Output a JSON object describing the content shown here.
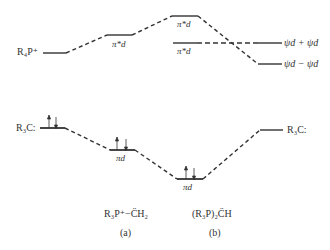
{
  "diagram": {
    "type": "molecular-orbital-energy-level-diagram",
    "upper": {
      "left_label": "R₄P⁺",
      "levels": [
        {
          "id": "pistar_a",
          "label": "π*d"
        },
        {
          "id": "pistar_b_upper",
          "label": "π*d"
        },
        {
          "id": "pistar_b_lower",
          "label": "π*d"
        }
      ],
      "right_levels": [
        {
          "id": "psi_plus",
          "label": "ψd + ψd"
        },
        {
          "id": "psi_minus",
          "label": "ψd − ψd"
        }
      ]
    },
    "lower": {
      "left_label": "R₃C:",
      "right_label": "R₃C:",
      "levels": [
        {
          "id": "pi_a",
          "label": "πd"
        },
        {
          "id": "pi_b",
          "label": "πd"
        }
      ]
    },
    "species": [
      {
        "id": "a",
        "formula": "R₃P⁺−C̈H₂",
        "tag": "(a)"
      },
      {
        "id": "b",
        "formula": "(R₃P)₂C̈H",
        "tag": "(b)"
      }
    ],
    "colors": {
      "line": "#333333",
      "text": "#333333"
    }
  }
}
